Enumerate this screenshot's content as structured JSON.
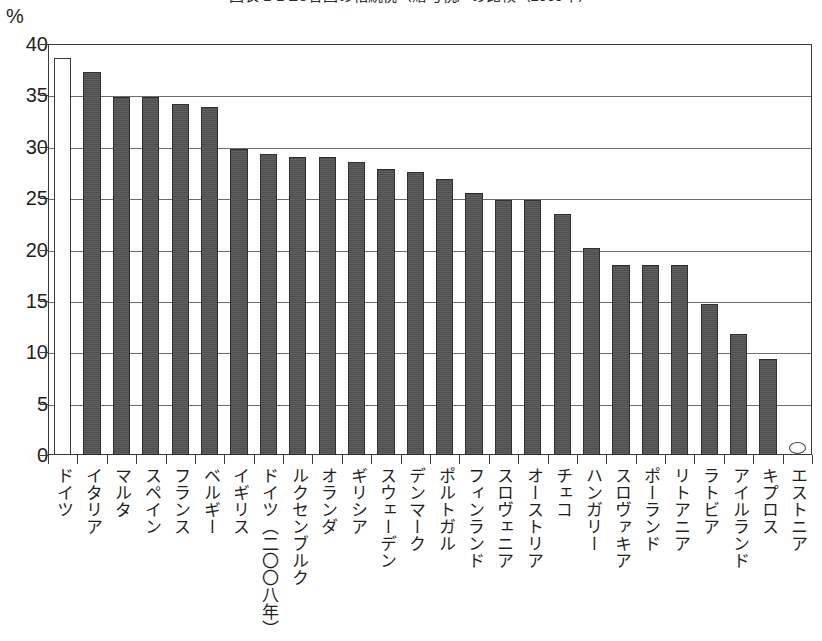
{
  "title": "図表 1-1 EU各国の相続税（贈与税）の比較（2009年）",
  "unit_label": "%",
  "axis": {
    "y_ticks": [
      "40",
      "35",
      "30",
      "25",
      "20",
      "15",
      "10",
      "5",
      "0"
    ],
    "y_min": 0,
    "y_max": 40,
    "y_step": 5
  },
  "chart_data": {
    "type": "bar",
    "title": "図表 1-1 EU各国の相続税（贈与税）の比較（2009年）",
    "xlabel": "",
    "ylabel": "%",
    "ylim": [
      0,
      40
    ],
    "ytick_step": 5,
    "grid": true,
    "legend": "none",
    "orientation": "vertical",
    "categories": [
      "ドイツ",
      "イタリア",
      "マルタ",
      "スペイン",
      "フランス",
      "ベルギー",
      "イギリス",
      "ドイツ（二〇〇八年）",
      "ルクセンブルク",
      "オランダ",
      "ギリシア",
      "スウェーデン",
      "デンマーク",
      "ポルトガル",
      "フィンランド",
      "スロヴェニア",
      "オーストリア",
      "チェコ",
      "ハンガリー",
      "スロヴァキア",
      "ポーランド",
      "リトアニア",
      "ラトビア",
      "アイルランド",
      "キプロス",
      "エストニア"
    ],
    "values": [
      38.6,
      37.3,
      34.8,
      34.8,
      34.2,
      33.9,
      29.8,
      29.3,
      29.0,
      29.0,
      28.5,
      27.8,
      27.5,
      26.9,
      25.5,
      24.8,
      24.8,
      23.5,
      20.1,
      18.5,
      18.5,
      18.5,
      14.7,
      11.8,
      9.3,
      0.0
    ],
    "highlight_index": 0,
    "highlight_style": "hollow-white-bar",
    "zero_indices": [
      25
    ],
    "zero_marker": "ellipse-outline"
  },
  "colors": {
    "bar_fill": "#4e4e4e",
    "bar_stroke": "#2f2f2f",
    "highlight_fill": "#ffffff",
    "axis": "#3a3a3a",
    "gridline": "#6c6c6c",
    "background": "#ffffff",
    "text": "#1f1f1f"
  }
}
